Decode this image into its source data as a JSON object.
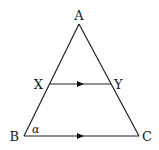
{
  "diagram": {
    "type": "triangle-with-parallel-line",
    "points": {
      "A": {
        "label": "A",
        "x": 79,
        "y": 24
      },
      "B": {
        "label": "B",
        "x": 24,
        "y": 136
      },
      "C": {
        "label": "C",
        "x": 139,
        "y": 136
      },
      "X": {
        "label": "X",
        "x": 49,
        "y": 84
      },
      "Y": {
        "label": "Y",
        "x": 111,
        "y": 84
      }
    },
    "angle_label": "α",
    "segments": [
      "AB",
      "AC",
      "BC",
      "XY"
    ],
    "parallel_marks": [
      "XY",
      "BC"
    ],
    "colors": {
      "stroke": "#222222",
      "background": "#ffffff"
    }
  }
}
